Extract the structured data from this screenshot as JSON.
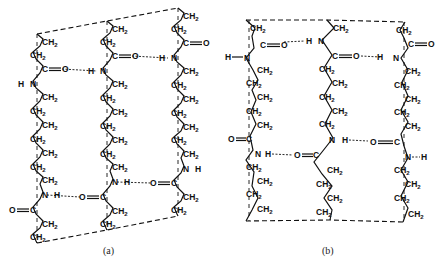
{
  "figure": {
    "captions": [
      {
        "id": "a",
        "text": "(a)",
        "x": 103,
        "y": 254
      },
      {
        "id": "b",
        "text": "(b)",
        "x": 322,
        "y": 254
      }
    ],
    "labels": {
      "ch2": "CH",
      "ch2_sub": "2",
      "carbon": "C",
      "oxygen": "O",
      "nitrogen": "N",
      "hydrogen": "H"
    },
    "panel_a": {
      "cell_top": [
        [
          37,
          34
        ],
        [
          107,
          21
        ],
        [
          178,
          8
        ]
      ],
      "cell_bottom": [
        [
          37,
          243
        ],
        [
          107,
          230
        ],
        [
          178,
          216
        ]
      ],
      "chains": [
        {
          "axis_x": 37,
          "y_top": 34,
          "y_bottom": 243,
          "units": [
            {
              "t": "CH2",
              "x": 42,
              "y": 45,
              "side": "r"
            },
            {
              "t": "CH2",
              "x": 30,
              "y": 58,
              "side": "l"
            },
            {
              "t": "CO",
              "x": 42,
              "y": 72,
              "side": "r"
            },
            {
              "t": "NH",
              "x": 30,
              "y": 87,
              "side": "l"
            },
            {
              "t": "CH2",
              "x": 42,
              "y": 100,
              "side": "r"
            },
            {
              "t": "CH2",
              "x": 30,
              "y": 114,
              "side": "l"
            },
            {
              "t": "CH2",
              "x": 42,
              "y": 128,
              "side": "r"
            },
            {
              "t": "CH2",
              "x": 30,
              "y": 142,
              "side": "l"
            },
            {
              "t": "CH2",
              "x": 42,
              "y": 156,
              "side": "r"
            },
            {
              "t": "CH2",
              "x": 30,
              "y": 170,
              "side": "l"
            },
            {
              "t": "CH2",
              "x": 42,
              "y": 183,
              "side": "r"
            },
            {
              "t": "NH",
              "x": 42,
              "y": 198,
              "side": "r"
            },
            {
              "t": "CO",
              "x": 30,
              "y": 213,
              "side": "l"
            },
            {
              "t": "CH2",
              "x": 42,
              "y": 227,
              "side": "r"
            },
            {
              "t": "CH2",
              "x": 30,
              "y": 240,
              "side": "l"
            }
          ]
        },
        {
          "axis_x": 107,
          "y_top": 21,
          "y_bottom": 230,
          "units": [
            {
              "t": "CH2",
              "x": 112,
              "y": 32,
              "side": "r"
            },
            {
              "t": "CH2",
              "x": 100,
              "y": 45,
              "side": "l"
            },
            {
              "t": "CO",
              "x": 112,
              "y": 59,
              "side": "r"
            },
            {
              "t": "NH",
              "x": 100,
              "y": 74,
              "side": "l"
            },
            {
              "t": "CH2",
              "x": 112,
              "y": 87,
              "side": "r"
            },
            {
              "t": "CH2",
              "x": 100,
              "y": 101,
              "side": "l"
            },
            {
              "t": "CH2",
              "x": 112,
              "y": 115,
              "side": "r"
            },
            {
              "t": "CH2",
              "x": 100,
              "y": 129,
              "side": "l"
            },
            {
              "t": "CH2",
              "x": 112,
              "y": 143,
              "side": "r"
            },
            {
              "t": "CH2",
              "x": 100,
              "y": 157,
              "side": "l"
            },
            {
              "t": "CH2",
              "x": 112,
              "y": 170,
              "side": "r"
            },
            {
              "t": "NH",
              "x": 112,
              "y": 185,
              "side": "r"
            },
            {
              "t": "CO",
              "x": 100,
              "y": 200,
              "side": "l"
            },
            {
              "t": "CH2",
              "x": 112,
              "y": 214,
              "side": "r"
            },
            {
              "t": "CH2",
              "x": 100,
              "y": 227,
              "side": "l"
            }
          ]
        },
        {
          "axis_x": 178,
          "y_top": 8,
          "y_bottom": 216,
          "units": [
            {
              "t": "CH2",
              "x": 183,
              "y": 19,
              "side": "r"
            },
            {
              "t": "CH2",
              "x": 171,
              "y": 32,
              "side": "l"
            },
            {
              "t": "CO",
              "x": 183,
              "y": 46,
              "side": "r"
            },
            {
              "t": "NH",
              "x": 171,
              "y": 61,
              "side": "l"
            },
            {
              "t": "CH2",
              "x": 183,
              "y": 74,
              "side": "r"
            },
            {
              "t": "CH2",
              "x": 171,
              "y": 88,
              "side": "l"
            },
            {
              "t": "CH2",
              "x": 183,
              "y": 102,
              "side": "r"
            },
            {
              "t": "CH2",
              "x": 171,
              "y": 116,
              "side": "l"
            },
            {
              "t": "CH2",
              "x": 183,
              "y": 130,
              "side": "r"
            },
            {
              "t": "CH2",
              "x": 171,
              "y": 143,
              "side": "l"
            },
            {
              "t": "CH2",
              "x": 183,
              "y": 157,
              "side": "r"
            },
            {
              "t": "NH",
              "x": 183,
              "y": 172,
              "side": "r"
            },
            {
              "t": "CO",
              "x": 171,
              "y": 186,
              "side": "l"
            },
            {
              "t": "CH2",
              "x": 183,
              "y": 200,
              "side": "r"
            },
            {
              "t": "CH2",
              "x": 171,
              "y": 213,
              "side": "l"
            }
          ]
        }
      ],
      "hbonds": [
        {
          "x1": 62,
          "y1": 72,
          "x2": 97,
          "y2": 74
        },
        {
          "x1": 132,
          "y1": 59,
          "x2": 168,
          "y2": 61
        },
        {
          "x1": 47,
          "y1": 198,
          "x2": 80,
          "y2": 200
        },
        {
          "x1": 117,
          "y1": 185,
          "x2": 151,
          "y2": 186
        }
      ],
      "free_h": [
        {
          "x": 9,
          "y": 87,
          "nx": 28
        },
        {
          "x": 203,
          "y": 172,
          "nx": 188
        }
      ],
      "free_o": [
        {
          "x": 206,
          "y": 46,
          "cx": 188
        },
        {
          "x": 9,
          "y": 213,
          "cx": 28
        }
      ]
    },
    "panel_b": {
      "cell_top": [
        [
          246,
          20
        ],
        [
          327,
          20
        ],
        [
          405,
          22
        ]
      ],
      "cell_bottom": [
        [
          246,
          221
        ],
        [
          330,
          220
        ],
        [
          403,
          222
        ]
      ]
    }
  }
}
